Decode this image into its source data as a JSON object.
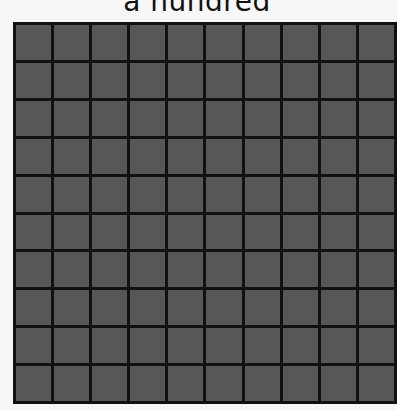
{
  "title": "a hundred",
  "grid": {
    "rows": 10,
    "columns": 10,
    "total_cells": 100,
    "cell_color": "#575757",
    "line_color": "#111111"
  }
}
